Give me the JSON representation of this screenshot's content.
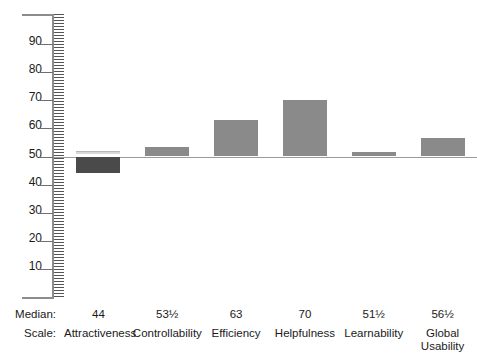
{
  "chart_data": {
    "type": "bar",
    "title": "",
    "subtitle": "",
    "xlabel": "",
    "ylabel": "",
    "ylim": [
      0,
      100
    ],
    "baseline": 50,
    "grid": false,
    "legend": null,
    "axis_style": "ruler-hatched",
    "tick_labels": [
      "90",
      "80",
      "70",
      "60",
      "50",
      "40",
      "30",
      "20",
      "10"
    ],
    "tick_values": [
      90,
      80,
      70,
      60,
      50,
      40,
      30,
      20,
      10
    ],
    "categories": [
      "Attractiveness",
      "Controllability",
      "Efficiency",
      "Helpfulness",
      "Learnability",
      "Global Usability"
    ],
    "values": [
      44,
      53.5,
      63,
      70,
      51.5,
      56.5
    ],
    "value_labels": [
      "44",
      "53½",
      "63",
      "70",
      "51½",
      "56½"
    ],
    "bar_directions": [
      "below",
      "above",
      "above",
      "above",
      "above",
      "above"
    ]
  },
  "axis": {
    "ticks": [
      {
        "label": "90",
        "value": 90
      },
      {
        "label": "80",
        "value": 80
      },
      {
        "label": "70",
        "value": 70
      },
      {
        "label": "60",
        "value": 60
      },
      {
        "label": "50",
        "value": 50
      },
      {
        "label": "40",
        "value": 40
      },
      {
        "label": "30",
        "value": 30
      },
      {
        "label": "20",
        "value": 20
      },
      {
        "label": "10",
        "value": 10
      }
    ]
  },
  "table": {
    "row_headers": {
      "median": "Median:",
      "scale": "Scale:"
    },
    "columns": [
      {
        "median": "44",
        "scale_line1": "Attractiveness",
        "scale_line2": ""
      },
      {
        "median": "53½",
        "scale_line1": "Controllability",
        "scale_line2": ""
      },
      {
        "median": "63",
        "scale_line1": "Efficiency",
        "scale_line2": ""
      },
      {
        "median": "70",
        "scale_line1": "Helpfulness",
        "scale_line2": ""
      },
      {
        "median": "51½",
        "scale_line1": "Learnability",
        "scale_line2": ""
      },
      {
        "median": "56½",
        "scale_line1": "Global",
        "scale_line2": "Usability"
      }
    ]
  },
  "colors": {
    "bar_below_baseline": "#4a4a4a",
    "bar_above_baseline": "#8a8a8a",
    "axis": "#8c8c8c",
    "baseline": "#9a9a9a",
    "text": "#1a1a1a",
    "background": "#ffffff"
  }
}
